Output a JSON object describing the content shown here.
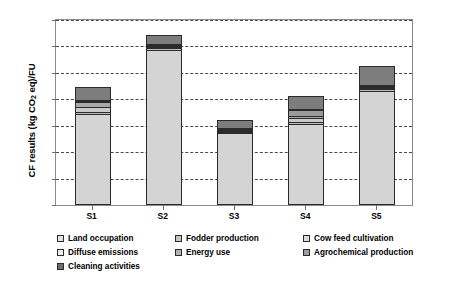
{
  "chart_data": {
    "type": "bar",
    "subtype": "stacked-column",
    "title": "",
    "xlabel": "",
    "ylabel": "CF results (kg CO2 eq)/FU",
    "ylabel_parts": {
      "pre": "CF results (kg CO",
      "sub": "2",
      "post": " eq)/FU"
    },
    "categories": [
      "S1",
      "S2",
      "S3",
      "S4",
      "S5"
    ],
    "ylim": [
      0.0,
      35.0
    ],
    "ytick_values": [
      0.0,
      5.0,
      10.0,
      15.0,
      20.0,
      25.0,
      30.0,
      35.0
    ],
    "ytick_labels": [
      "0.0",
      "5.0",
      "10.0",
      "15.0",
      "20.0",
      "25.0",
      "30.0",
      "35.0"
    ],
    "grid": true,
    "grid_style": "dashed",
    "legend_position": "below",
    "series": [
      {
        "name": "Land occupation",
        "color": "#d4d4d4",
        "values": [
          16.8,
          29.0,
          13.2,
          14.9,
          21.2
        ]
      },
      {
        "name": "Fodder production",
        "color": "#bdbdbd",
        "values": [
          0.4,
          0.3,
          0.3,
          0.4,
          0.35
        ]
      },
      {
        "name": "Cow feed cultivation",
        "color": "#c9c9c9",
        "values": [
          0.9,
          0.15,
          0.15,
          0.7,
          0.25
        ]
      },
      {
        "name": "Diffuse emissions",
        "color": "#a8a8a8",
        "values": [
          0.95,
          0.1,
          0.1,
          0.55,
          0.2
        ]
      },
      {
        "name": "Energy use",
        "color": "#9a9a9a",
        "values": [
          0.1,
          0.1,
          0.1,
          1.05,
          0.15
        ]
      },
      {
        "name": "Agrochemical production",
        "color": "#8f8f8f",
        "values": [
          0.1,
          0.1,
          0.1,
          0.1,
          0.1
        ]
      },
      {
        "name": "Cleaning activities",
        "color": "#7d7d7d",
        "values": [
          2.5,
          1.8,
          1.4,
          2.4,
          3.55
        ]
      }
    ],
    "totals": [
      20.85,
      31.55,
      15.35,
      20.1,
      25.82
    ],
    "annotations": []
  },
  "legend": {
    "entries": [
      {
        "label": "Land occupation",
        "color": "#e2e2e2"
      },
      {
        "label": "Fodder production",
        "color": "#c6c6c6"
      },
      {
        "label": "Cow feed cultivation",
        "color": "#dcdcdc"
      },
      {
        "label": "Diffuse emissions",
        "color": "#ededed"
      },
      {
        "label": "Energy use",
        "color": "#b4b4b4"
      },
      {
        "label": "Agrochemical production",
        "color": "#9c9c9c"
      },
      {
        "label": "Cleaning activities",
        "color": "#6e6e6e"
      }
    ]
  }
}
